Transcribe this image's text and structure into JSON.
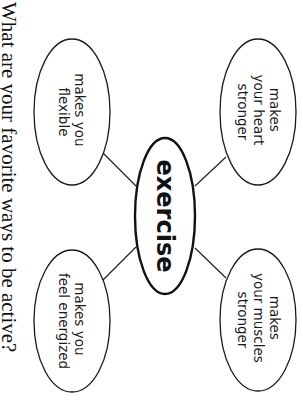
{
  "diagram": {
    "type": "concept-web",
    "orientation": "rotated-90-clockwise",
    "center": {
      "label": "exercise"
    },
    "bubbles": [
      {
        "position": "top-right",
        "lines": [
          "makes",
          "your heart",
          "stronger"
        ]
      },
      {
        "position": "bottom-right",
        "lines": [
          "makes",
          "your muscles",
          "stronger"
        ]
      },
      {
        "position": "top-left",
        "lines": [
          "makes you",
          "flexible"
        ]
      },
      {
        "position": "bottom-left",
        "lines": [
          "makes you",
          "feel energized"
        ]
      }
    ],
    "question": "What are your favorite ways to be active?"
  }
}
